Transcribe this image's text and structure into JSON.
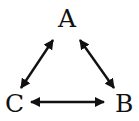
{
  "diagram": {
    "type": "triangle-bidirectional-graph",
    "colors": {
      "foreground": "#111111",
      "background": "#ffffff"
    },
    "nodes": [
      {
        "id": "A",
        "label": "A",
        "x": 68,
        "y": 18
      },
      {
        "id": "B",
        "label": "B",
        "x": 124,
        "y": 103
      },
      {
        "id": "C",
        "label": "C",
        "x": 15,
        "y": 103
      }
    ],
    "edges": [
      {
        "from": "A",
        "to": "C",
        "direction": "bidirectional"
      },
      {
        "from": "A",
        "to": "B",
        "direction": "bidirectional"
      },
      {
        "from": "C",
        "to": "B",
        "direction": "bidirectional"
      }
    ]
  }
}
